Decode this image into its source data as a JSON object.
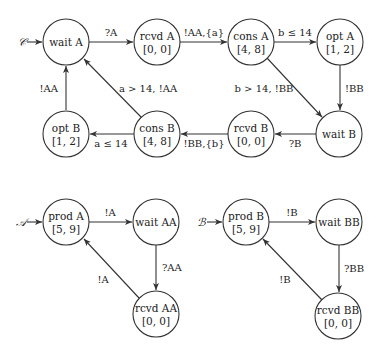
{
  "automata": {
    "C": {
      "name": "𝒞",
      "nodes": {
        "wait_A": {
          "name": "wait A",
          "interval": ""
        },
        "rcvd_A": {
          "name": "rcvd A",
          "interval": "[0, 0]"
        },
        "cons_A": {
          "name": "cons A",
          "interval": "[4, 8]"
        },
        "opt_A": {
          "name": "opt A",
          "interval": "[1, 2]"
        },
        "wait_B": {
          "name": "wait B",
          "interval": ""
        },
        "rcvd_B": {
          "name": "rcvd B",
          "interval": "[0, 0]"
        },
        "cons_B": {
          "name": "cons B",
          "interval": "[4, 8]"
        },
        "opt_B": {
          "name": "opt B",
          "interval": "[1, 2]"
        }
      },
      "edges": {
        "waitA_rcvdA": "?A",
        "rcvdA_consA": "!AA,{a}",
        "consA_optA": "b ≤ 14",
        "consA_waitB": "b > 14, !BB",
        "optA_waitB": "!BB",
        "waitB_rcvdB": "?B",
        "rcvdB_consB": "!BB,{b}",
        "consB_optB": "a ≤ 14",
        "consB_waitA": "a > 14, !AA",
        "optB_waitA": "!AA"
      }
    },
    "A": {
      "name": "𝒜",
      "nodes": {
        "prod_A": {
          "name": "prod A",
          "interval": "[5, 9]"
        },
        "wait_AA": {
          "name": "wait AA",
          "interval": ""
        },
        "rcvd_AA": {
          "name": "rcvd AA",
          "interval": "[0, 0]"
        }
      },
      "edges": {
        "prodA_waitAA": "!A",
        "waitAA_rcvdAA": "?AA",
        "rcvdAA_prodA": "!A"
      }
    },
    "B": {
      "name": "ℬ",
      "nodes": {
        "prod_B": {
          "name": "prod B",
          "interval": "[5, 9]"
        },
        "wait_BB": {
          "name": "wait BB",
          "interval": ""
        },
        "rcvd_BB": {
          "name": "rcvd BB",
          "interval": "[0, 0]"
        }
      },
      "edges": {
        "prodB_waitBB": "!B",
        "waitBB_rcvdBB": "?BB",
        "rcvdBB_prodB": "!B"
      }
    }
  },
  "colors": {
    "stroke": "#333333",
    "text": "#222222",
    "background": "#ffffff"
  }
}
